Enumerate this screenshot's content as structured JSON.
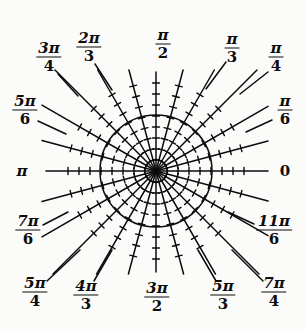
{
  "figure": {
    "type": "polar-grid",
    "width": 305,
    "height": 332,
    "background_color": "#fbfbf9",
    "ink_color": "#0c0c0c"
  },
  "geometry": {
    "center_x": 156,
    "center_y": 171,
    "unit_circle_radius": 56,
    "ray_count": 24,
    "tick_spacing_px": 11,
    "ticks_per_ray": 8,
    "tick_half_length_px": 3.5
  },
  "axes": {
    "horizontal_left_x": 46,
    "horizontal_right_x": 268,
    "vertical_top_y": 72,
    "vertical_bottom_y": 272
  },
  "labels": [
    {
      "name": "zero",
      "degrees": 0,
      "text": "0",
      "kind": "plain",
      "num": "0",
      "den": "",
      "x": 285,
      "y": 171,
      "leader": false
    },
    {
      "name": "pi-over-6",
      "degrees": 30,
      "text": "π/6",
      "kind": "frac",
      "num": "π",
      "den": "6",
      "x": 285,
      "y": 110,
      "leader": true,
      "lx1": 272,
      "ly1": 120,
      "lx2": 246,
      "ly2": 132
    },
    {
      "name": "pi-over-4",
      "degrees": 45,
      "text": "π/4",
      "kind": "frac",
      "num": "π",
      "den": "4",
      "x": 276,
      "y": 57,
      "leader": true,
      "lx1": 268,
      "ly1": 72,
      "lx2": 240,
      "ly2": 94
    },
    {
      "name": "pi-over-3",
      "degrees": 60,
      "text": "π/3",
      "kind": "frac",
      "num": "π",
      "den": "3",
      "x": 232,
      "y": 48,
      "leader": true,
      "lx1": 226,
      "ly1": 62,
      "lx2": 206,
      "ly2": 89
    },
    {
      "name": "pi-over-2",
      "degrees": 90,
      "text": "π/2",
      "kind": "frac",
      "num": "π",
      "den": "2",
      "x": 163,
      "y": 44,
      "leader": false
    },
    {
      "name": "two-pi-over-3",
      "degrees": 120,
      "text": "2π/3",
      "kind": "frac",
      "num": "2π",
      "den": "3",
      "x": 89,
      "y": 47,
      "leader": true,
      "lx1": 95,
      "ly1": 64,
      "lx2": 112,
      "ly2": 90
    },
    {
      "name": "three-pi-over-4",
      "degrees": 135,
      "text": "3π/4",
      "kind": "frac",
      "num": "3π",
      "den": "4",
      "x": 49,
      "y": 57,
      "leader": true,
      "lx1": 58,
      "ly1": 74,
      "lx2": 78,
      "ly2": 96
    },
    {
      "name": "five-pi-over-6",
      "degrees": 150,
      "text": "5π/6",
      "kind": "frac",
      "num": "5π",
      "den": "6",
      "x": 25,
      "y": 110,
      "leader": true,
      "lx1": 38,
      "ly1": 121,
      "lx2": 66,
      "ly2": 134
    },
    {
      "name": "pi",
      "degrees": 180,
      "text": "π",
      "kind": "plain",
      "num": "π",
      "den": "",
      "x": 22,
      "y": 171,
      "leader": false
    },
    {
      "name": "seven-pi-over-6",
      "degrees": 210,
      "text": "7π/6",
      "kind": "frac",
      "num": "7π",
      "den": "6",
      "x": 28,
      "y": 230,
      "leader": true,
      "lx1": 43,
      "ly1": 225,
      "lx2": 68,
      "ly2": 212
    },
    {
      "name": "five-pi-over-4",
      "degrees": 225,
      "text": "5π/4",
      "kind": "frac",
      "num": "5π",
      "den": "4",
      "x": 35,
      "y": 292,
      "leader": true,
      "lx1": 47,
      "ly1": 281,
      "lx2": 80,
      "ly2": 250
    },
    {
      "name": "four-pi-over-3",
      "degrees": 240,
      "text": "4π/3",
      "kind": "frac",
      "num": "4π",
      "den": "3",
      "x": 86,
      "y": 295,
      "leader": true,
      "lx1": 94,
      "ly1": 281,
      "lx2": 112,
      "ly2": 250
    },
    {
      "name": "three-pi-over-2",
      "degrees": 270,
      "text": "3π/2",
      "kind": "frac",
      "num": "3π",
      "den": "2",
      "x": 157,
      "y": 297,
      "leader": false
    },
    {
      "name": "five-pi-over-3",
      "degrees": 300,
      "text": "5π/3",
      "kind": "frac",
      "num": "5π",
      "den": "3",
      "x": 223,
      "y": 295,
      "leader": true,
      "lx1": 216,
      "ly1": 281,
      "lx2": 198,
      "ly2": 250
    },
    {
      "name": "seven-pi-over-4",
      "degrees": 315,
      "text": "7π/4",
      "kind": "frac",
      "num": "7π",
      "den": "4",
      "x": 274,
      "y": 292,
      "leader": true,
      "lx1": 263,
      "ly1": 281,
      "lx2": 232,
      "ly2": 250
    },
    {
      "name": "eleven-pi-over-6",
      "degrees": 330,
      "text": "11π/6",
      "kind": "frac",
      "num": "11π",
      "den": "6",
      "x": 274,
      "y": 230,
      "leader": true,
      "lx1": 254,
      "ly1": 224,
      "lx2": 228,
      "ly2": 212
    }
  ]
}
